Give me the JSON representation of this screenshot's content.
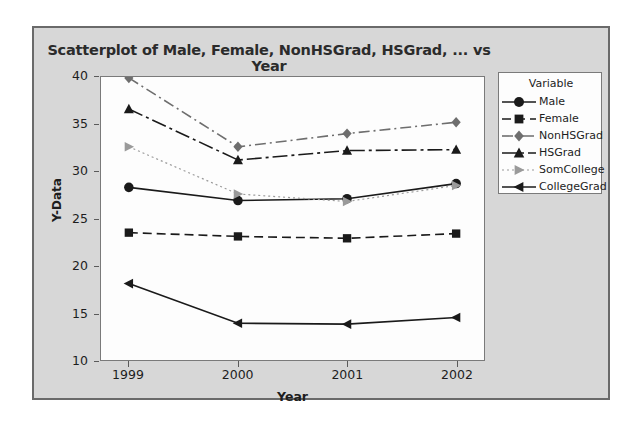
{
  "chart_data": {
    "type": "line",
    "title": "Scatterplot of Male, Female, NonHSGrad, HSGrad, ... vs Year",
    "xlabel": "Year",
    "ylabel": "Y-Data",
    "categories": [
      "1999",
      "2000",
      "2001",
      "2002"
    ],
    "x": [
      1999,
      2000,
      2001,
      2002
    ],
    "xlim": [
      1999,
      2002
    ],
    "ylim": [
      10,
      40
    ],
    "yticks": [
      10,
      15,
      20,
      25,
      30,
      35,
      40
    ],
    "grid": false,
    "legend_position": "right",
    "legend_title": "Variable",
    "series": [
      {
        "name": "Male",
        "values": [
          28.3,
          26.9,
          27.1,
          28.7
        ],
        "marker": "circle",
        "line_style": "solid",
        "color": "#1a1a1a"
      },
      {
        "name": "Female",
        "values": [
          23.5,
          23.1,
          22.9,
          23.4
        ],
        "marker": "square",
        "line_style": "dashed",
        "color": "#1a1a1a"
      },
      {
        "name": "NonHSGrad",
        "values": [
          39.9,
          32.6,
          34.0,
          35.2
        ],
        "marker": "diamond",
        "line_style": "dash-dot",
        "color": "#6e6e6e"
      },
      {
        "name": "HSGrad",
        "values": [
          36.6,
          31.2,
          32.2,
          32.3
        ],
        "marker": "triangle-up",
        "line_style": "long-dash-dot",
        "color": "#1a1a1a"
      },
      {
        "name": "SomCollege",
        "values": [
          32.6,
          27.6,
          26.8,
          28.5
        ],
        "marker": "triangle-right",
        "line_style": "dotted",
        "color": "#9a9a9a"
      },
      {
        "name": "CollegeGrad",
        "values": [
          18.1,
          13.9,
          13.8,
          14.5
        ],
        "marker": "triangle-left",
        "line_style": "solid",
        "color": "#1a1a1a"
      }
    ]
  },
  "colors": {
    "panel_background": "#d7d7d7",
    "plot_background": "#fdfdfd",
    "panel_border": "#6a6a6a",
    "axis": "#5a5a5a",
    "text": "#1d1d1d"
  }
}
